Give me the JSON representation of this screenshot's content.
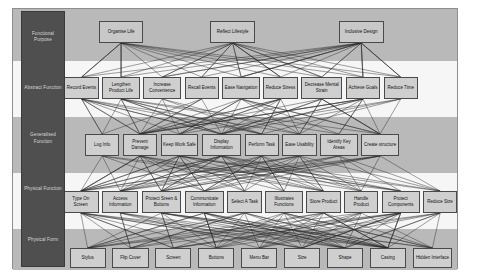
{
  "diagram": {
    "frame": {
      "fill": "#b9b9b9",
      "border": "#8e8e8e"
    },
    "band_colors": {
      "gray": "#b9b9b9",
      "white": "#f6f6f6"
    },
    "node_colors": {
      "fill": "#cfcfcf",
      "border": "#4a4a4a",
      "text": "#101010"
    },
    "edge_color": "#2b2b2b",
    "level_column": {
      "fill": "#4f4f4f",
      "text": "#d8d8d8"
    }
  },
  "levels": [
    {
      "id": "functional-purpose",
      "label": "Functional Purpose"
    },
    {
      "id": "abstract-function",
      "label": "Abstract Function"
    },
    {
      "id": "generalised-function",
      "label": "Generalised Function"
    },
    {
      "id": "physical-function",
      "label": "Physical Function"
    },
    {
      "id": "physical-form",
      "label": "Physical Form"
    }
  ],
  "rows": [
    {
      "level": "functional-purpose",
      "nodes": [
        {
          "label": "Organise Life",
          "x": 100,
          "y": 12,
          "w": 52,
          "h": 22
        },
        {
          "label": "Reflect Lifestyle",
          "x": 230,
          "y": 12,
          "w": 52,
          "h": 22
        },
        {
          "label": "Inclusive Design",
          "x": 380,
          "y": 12,
          "w": 52,
          "h": 22
        }
      ]
    },
    {
      "level": "abstract-function",
      "nodes": [
        {
          "label": "Record Events",
          "x": 60,
          "y": 68,
          "w": 40,
          "h": 22
        },
        {
          "label": "Lengthen Product Life",
          "x": 104,
          "y": 68,
          "w": 44,
          "h": 22
        },
        {
          "label": "Increase Convenience",
          "x": 152,
          "y": 68,
          "w": 44,
          "h": 22
        },
        {
          "label": "Recall Events",
          "x": 200,
          "y": 68,
          "w": 40,
          "h": 22
        },
        {
          "label": "Ease Navigation",
          "x": 244,
          "y": 68,
          "w": 44,
          "h": 22
        },
        {
          "label": "Reduce Stress",
          "x": 292,
          "y": 68,
          "w": 40,
          "h": 22
        },
        {
          "label": "Decrease Mental Strain",
          "x": 336,
          "y": 68,
          "w": 48,
          "h": 22
        },
        {
          "label": "Achieve Goals",
          "x": 388,
          "y": 68,
          "w": 40,
          "h": 22
        },
        {
          "label": "Reduce Time",
          "x": 432,
          "y": 68,
          "w": 40,
          "h": 22
        }
      ]
    },
    {
      "level": "generalised-function",
      "nodes": [
        {
          "label": "Log Info",
          "x": 84,
          "y": 125,
          "w": 40,
          "h": 22
        },
        {
          "label": "Prevent Damage",
          "x": 128,
          "y": 125,
          "w": 40,
          "h": 22
        },
        {
          "label": "Keep Work Safe",
          "x": 172,
          "y": 125,
          "w": 44,
          "h": 22
        },
        {
          "label": "Display Information",
          "x": 220,
          "y": 125,
          "w": 46,
          "h": 22
        },
        {
          "label": "Perform Task",
          "x": 270,
          "y": 125,
          "w": 40,
          "h": 22
        },
        {
          "label": "Ease Usability",
          "x": 314,
          "y": 125,
          "w": 40,
          "h": 22
        },
        {
          "label": "Identify Key Areas",
          "x": 358,
          "y": 125,
          "w": 44,
          "h": 22
        },
        {
          "label": "Create structure",
          "x": 406,
          "y": 125,
          "w": 44,
          "h": 22
        }
      ]
    },
    {
      "level": "physical-function",
      "nodes": [
        {
          "label": "Type On Screen",
          "x": 58,
          "y": 182,
          "w": 42,
          "h": 22
        },
        {
          "label": "Access Information",
          "x": 104,
          "y": 182,
          "w": 42,
          "h": 22
        },
        {
          "label": "Protect Sreen & Buttons",
          "x": 150,
          "y": 182,
          "w": 46,
          "h": 22
        },
        {
          "label": "Communicate Information",
          "x": 200,
          "y": 182,
          "w": 46,
          "h": 22
        },
        {
          "label": "Select A Task",
          "x": 250,
          "y": 182,
          "w": 40,
          "h": 22
        },
        {
          "label": "Illustrates Functions",
          "x": 294,
          "y": 182,
          "w": 44,
          "h": 22
        },
        {
          "label": "Store Product",
          "x": 342,
          "y": 182,
          "w": 40,
          "h": 22
        },
        {
          "label": "Handle Product",
          "x": 386,
          "y": 182,
          "w": 40,
          "h": 22
        },
        {
          "label": "Protect Components",
          "x": 430,
          "y": 182,
          "w": 44,
          "h": 22
        },
        {
          "label": "Reduce Size",
          "x": 478,
          "y": 182,
          "w": 40,
          "h": 22
        }
      ]
    },
    {
      "level": "physical-form",
      "nodes": [
        {
          "label": "Stylus",
          "x": 66,
          "y": 239,
          "w": 42,
          "h": 20
        },
        {
          "label": "Flip Cover",
          "x": 116,
          "y": 239,
          "w": 42,
          "h": 20
        },
        {
          "label": "Screen",
          "x": 166,
          "y": 239,
          "w": 42,
          "h": 20
        },
        {
          "label": "Buttons",
          "x": 216,
          "y": 239,
          "w": 42,
          "h": 20
        },
        {
          "label": "Menu Bar",
          "x": 266,
          "y": 239,
          "w": 42,
          "h": 20
        },
        {
          "label": "Size",
          "x": 316,
          "y": 239,
          "w": 42,
          "h": 20
        },
        {
          "label": "Shape",
          "x": 366,
          "y": 239,
          "w": 42,
          "h": 20
        },
        {
          "label": "Casing",
          "x": 416,
          "y": 239,
          "w": 42,
          "h": 20
        },
        {
          "label": "Hidden Interface",
          "x": 466,
          "y": 239,
          "w": 46,
          "h": 20
        }
      ]
    }
  ],
  "bands": [
    {
      "y": 0,
      "h": 52,
      "tone": "gray"
    },
    {
      "y": 52,
      "h": 56,
      "tone": "white"
    },
    {
      "y": 108,
      "h": 56,
      "tone": "gray"
    },
    {
      "y": 164,
      "h": 56,
      "tone": "white"
    },
    {
      "y": 220,
      "h": 41,
      "tone": "gray"
    }
  ]
}
